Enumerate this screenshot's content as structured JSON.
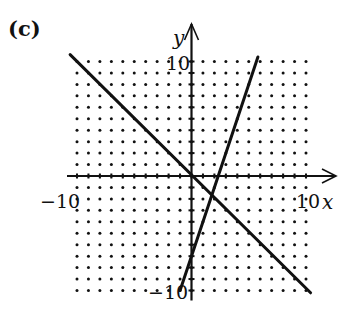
{
  "panel_label": "(c)",
  "colors": {
    "ink": "#111111",
    "background": "#ffffff"
  },
  "chart_data": {
    "type": "line",
    "title": "",
    "xlabel": "x",
    "ylabel": "y",
    "xlim": [
      -10,
      10
    ],
    "ylim": [
      -10,
      10
    ],
    "grid": "dotted lattice, integer points",
    "tick_labels": {
      "x_min": "−10",
      "x_max": "10",
      "y_max": "10",
      "y_min": "−10"
    },
    "series": [
      {
        "name": "decreasing line",
        "equation": "y = -x",
        "points": [
          [
            -10.6,
            10.6
          ],
          [
            10.4,
            -10.2
          ]
        ]
      },
      {
        "name": "increasing line",
        "equation": "y = 3x - 7",
        "points": [
          [
            -1,
            -10
          ],
          [
            5.8,
            10.4
          ]
        ]
      }
    ],
    "intersection": [
      1.75,
      -1.75
    ]
  },
  "layout": {
    "origin_px": [
      191.5,
      176
    ],
    "unit_px": 11.45,
    "x_arrow_tip_px": 336,
    "y_arrow_tip_px": 24
  }
}
